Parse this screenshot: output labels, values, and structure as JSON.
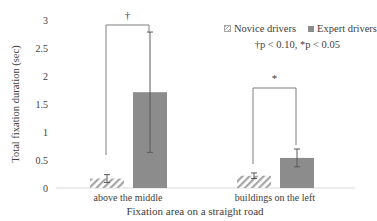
{
  "chart_data": {
    "type": "bar",
    "title": "",
    "xlabel": "Fixation area on a straight road",
    "ylabel": "Total fixation duration (sec)",
    "ylim": [
      0,
      3
    ],
    "yticks": [
      "0",
      "0.5",
      "1",
      "1.5",
      "2",
      "2.5",
      "3"
    ],
    "grid": false,
    "legend_position": "top-right",
    "categories": [
      "above the middle",
      "buildings on the left"
    ],
    "series": [
      {
        "name": "Novice drivers",
        "values": [
          0.17,
          0.22
        ],
        "error": [
          0.07,
          0.05
        ],
        "pattern": "hatched"
      },
      {
        "name": "Expert drivers",
        "values": [
          1.72,
          0.54
        ],
        "error": [
          1.08,
          0.16
        ],
        "color": "#8c8c8c"
      }
    ],
    "annotations": [
      {
        "category": "above the middle",
        "symbol": "†",
        "meaning": "p < 0.10"
      },
      {
        "category": "buildings on the left",
        "symbol": "*",
        "meaning": "p < 0.05"
      }
    ],
    "significance_note": "†p < 0.10, *p < 0.05"
  },
  "legend": {
    "novice": "Novice drivers",
    "expert": "Expert drivers"
  },
  "colors": {
    "expert_bar": "#8c8c8c",
    "novice_hatch": "#a6a6a6",
    "axis": "#d9d9d9",
    "error_bar": "#595959",
    "text": "#404040"
  }
}
